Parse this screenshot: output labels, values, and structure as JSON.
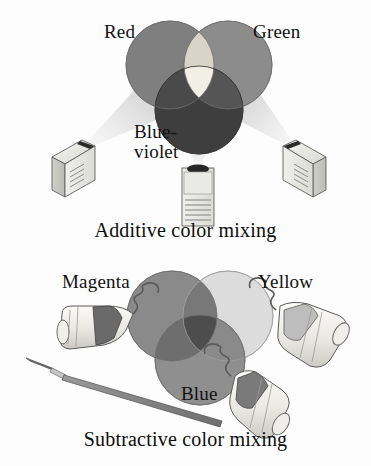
{
  "figure": {
    "title": "Additive and subtractive color mixing",
    "background_color": "#fdfdfd",
    "rendering": "grayscale halftone illustration",
    "width": 371,
    "height": 466
  },
  "additive": {
    "caption": "Additive color mixing",
    "labels": {
      "left": "Red",
      "right": "Green",
      "bottom_line1": "Blue-",
      "bottom_line2": "violet"
    },
    "circles": [
      {
        "name": "red-light-circle",
        "label": "Red",
        "cx": 170,
        "cy": 65,
        "r": 44,
        "fill": "#7f7f7f"
      },
      {
        "name": "green-light-circle",
        "label": "Green",
        "cx": 228,
        "cy": 65,
        "r": 44,
        "fill": "#8c8c8c"
      },
      {
        "name": "blue-violet-light-circle",
        "label": "Blue-violet",
        "cx": 199,
        "cy": 110,
        "r": 44,
        "fill": "#3e3e3e"
      }
    ],
    "overlaps": {
      "red_green": "#d8d4c8",
      "center_white": "#f2efe6",
      "red_blue": "#4a4a4a",
      "green_blue": "#555555"
    },
    "projectors": [
      {
        "name": "projector-left",
        "orientation": "isometric-left",
        "beam_color": "#e2e2e2"
      },
      {
        "name": "projector-center",
        "orientation": "front",
        "beam_color": "#e6e6e6"
      },
      {
        "name": "projector-right",
        "orientation": "isometric-right",
        "beam_color": "#e2e2e2"
      }
    ]
  },
  "subtractive": {
    "caption": "Subtractive color mixing",
    "labels": {
      "left": "Magenta",
      "right": "Yellow",
      "bottom": "Blue"
    },
    "circles": [
      {
        "name": "magenta-paint-circle",
        "label": "Magenta",
        "cx": 172,
        "cy": 68,
        "r": 45,
        "fill": "#8a8a8a"
      },
      {
        "name": "yellow-paint-circle",
        "label": "Yellow",
        "cx": 228,
        "cy": 68,
        "r": 45,
        "fill": "#dcdcdc"
      },
      {
        "name": "blue-paint-circle",
        "label": "Blue",
        "cx": 200,
        "cy": 112,
        "r": 45,
        "fill": "#8f8f8f"
      }
    ],
    "overlaps": {
      "magenta_yellow": "#787878",
      "center_dark": "#4d4d4d",
      "magenta_blue": "#6e6e6e",
      "yellow_blue": "#8a8a8a"
    },
    "paint_tubes": [
      {
        "name": "paint-tube-magenta",
        "band_color": "#6a6a6a",
        "body_color": "#eceae6"
      },
      {
        "name": "paint-tube-yellow",
        "band_color": "#bdbdbd",
        "body_color": "#efeee9"
      },
      {
        "name": "paint-tube-blue",
        "band_color": "#7a7a7a",
        "body_color": "#ecebe6"
      }
    ],
    "brush": {
      "name": "paintbrush",
      "ferrule_color": "#b9b9b9",
      "handle_color": "#8e8e8e"
    }
  }
}
